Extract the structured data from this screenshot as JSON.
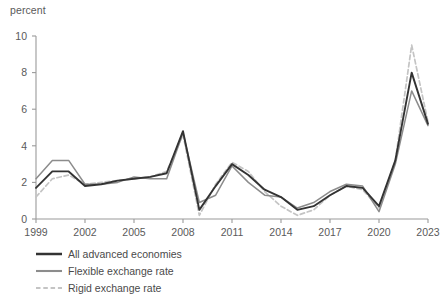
{
  "chart_data": {
    "type": "line",
    "title": "",
    "subtitle": "",
    "xlabel": "",
    "ylabel": "percent",
    "ylim": [
      0,
      10
    ],
    "xlim": [
      1999,
      2023
    ],
    "grid": false,
    "legend_position": "bottom-left",
    "y_ticks": [
      0,
      2,
      4,
      6,
      8,
      10
    ],
    "x_ticks": [
      1999,
      2002,
      2005,
      2008,
      2011,
      2014,
      2017,
      2020,
      2023
    ],
    "x": [
      1999,
      2000,
      2001,
      2002,
      2003,
      2004,
      2005,
      2006,
      2007,
      2008,
      2009,
      2010,
      2011,
      2012,
      2013,
      2014,
      2015,
      2016,
      2017,
      2018,
      2019,
      2020,
      2021,
      2022,
      2023
    ],
    "series": [
      {
        "name": "All advanced economies",
        "color": "#333333",
        "style": "solid",
        "width": 1.9,
        "values": [
          1.7,
          2.6,
          2.6,
          1.8,
          1.9,
          2.1,
          2.2,
          2.3,
          2.5,
          4.8,
          0.5,
          1.8,
          3.0,
          2.4,
          1.6,
          1.2,
          0.5,
          0.7,
          1.3,
          1.8,
          1.7,
          0.7,
          3.2,
          8.0,
          5.2
        ]
      },
      {
        "name": "Flexible exchange rate",
        "color": "#8c8c8c",
        "style": "solid",
        "width": 1.5,
        "values": [
          2.2,
          3.2,
          3.2,
          1.9,
          1.9,
          2.0,
          2.3,
          2.2,
          2.2,
          4.7,
          0.9,
          1.3,
          2.9,
          2.0,
          1.3,
          1.2,
          0.6,
          0.9,
          1.5,
          1.9,
          1.8,
          0.4,
          3.0,
          7.0,
          5.1
        ]
      },
      {
        "name": "Rigid exchange rate",
        "color": "#c4c4c4",
        "style": "dashed",
        "width": 1.7,
        "values": [
          1.2,
          2.2,
          2.4,
          1.9,
          2.0,
          2.1,
          2.2,
          2.3,
          2.6,
          4.6,
          0.2,
          1.9,
          3.1,
          2.6,
          1.5,
          0.7,
          0.2,
          0.5,
          1.3,
          1.8,
          1.6,
          0.6,
          3.2,
          9.5,
          5.3
        ]
      }
    ]
  },
  "legend": {
    "items": [
      {
        "label": "All advanced economies"
      },
      {
        "label": "Flexible exchange rate"
      },
      {
        "label": "Rigid exchange rate"
      }
    ]
  },
  "axis": {
    "y_unit": "percent"
  }
}
